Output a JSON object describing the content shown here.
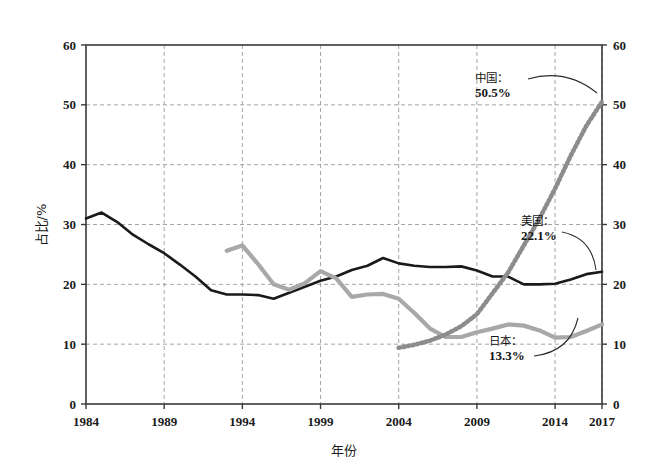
{
  "chart_data": {
    "type": "line",
    "title": "",
    "subtitle": "",
    "xlabel": "年份",
    "ylabel": "占比/%",
    "ylabel_right": "",
    "xlim": [
      1984,
      2017
    ],
    "ylim": [
      0,
      60
    ],
    "grid": true,
    "legend_position": "none",
    "xticks": [
      "1984",
      "1989",
      "1994",
      "1999",
      "2004",
      "2009",
      "2014",
      "2017"
    ],
    "xtick_values": [
      1984,
      1989,
      1994,
      1999,
      2004,
      2009,
      2014,
      2017
    ],
    "yticks": [
      "0",
      "10",
      "20",
      "30",
      "40",
      "50",
      "60"
    ],
    "ytick_values": [
      0,
      10,
      20,
      30,
      40,
      50,
      60
    ],
    "yticks_right": [
      "0",
      "10",
      "20",
      "30",
      "40",
      "50",
      "60"
    ],
    "dual_axis": true,
    "series": [
      {
        "name": "美国",
        "label": "美国：",
        "end_value_label": "22.1%",
        "color": "#1a1a1a",
        "style": "solid",
        "width": 2.6,
        "x": [
          1984,
          1985,
          1986,
          1987,
          1988,
          1989,
          1990,
          1991,
          1992,
          1993,
          1994,
          1995,
          1996,
          1997,
          1998,
          1999,
          2000,
          2001,
          2002,
          2003,
          2004,
          2005,
          2006,
          2007,
          2008,
          2009,
          2010,
          2011,
          2012,
          2013,
          2014,
          2015,
          2016,
          2017
        ],
        "values": [
          31.0,
          32.0,
          30.4,
          28.3,
          26.7,
          25.2,
          23.3,
          21.3,
          19.0,
          18.3,
          18.3,
          18.2,
          17.6,
          18.6,
          19.6,
          20.6,
          21.3,
          22.4,
          23.1,
          24.4,
          23.5,
          23.1,
          22.9,
          22.9,
          23.0,
          22.3,
          21.3,
          21.3,
          20.0,
          20.0,
          20.1,
          20.8,
          21.7,
          22.1
        ]
      },
      {
        "name": "日本",
        "label": "日本：",
        "end_value_label": "13.3%",
        "color": "#a8a8a8",
        "style": "solid",
        "width": 4.2,
        "x": [
          1993,
          1994,
          1995,
          1996,
          1997,
          1998,
          1999,
          2000,
          2001,
          2002,
          2003,
          2004,
          2005,
          2006,
          2007,
          2008,
          2009,
          2010,
          2011,
          2012,
          2013,
          2014,
          2015,
          2016,
          2017
        ],
        "values": [
          25.6,
          26.5,
          23.4,
          20.0,
          19.1,
          20.2,
          22.2,
          21.0,
          17.9,
          18.3,
          18.4,
          17.6,
          15.2,
          12.6,
          11.2,
          11.2,
          12.0,
          12.6,
          13.3,
          13.1,
          12.3,
          11.1,
          11.2,
          12.2,
          13.3
        ]
      },
      {
        "name": "中国",
        "label": "中国：",
        "end_value_label": "50.5%",
        "color": "#8c8c8c",
        "style": "dotted",
        "width": 4.6,
        "x": [
          2004,
          2005,
          2006,
          2007,
          2008,
          2009,
          2010,
          2011,
          2012,
          2013,
          2014,
          2015,
          2016,
          2017
        ],
        "values": [
          9.4,
          9.9,
          10.6,
          11.6,
          13.0,
          15.0,
          18.5,
          22.0,
          26.5,
          31.0,
          36.0,
          41.5,
          46.5,
          50.5
        ]
      }
    ],
    "annotations": [
      {
        "id": "china",
        "country": "中国：",
        "value": "50.5%",
        "x_px": 475,
        "y_px": 82
      },
      {
        "id": "usa",
        "country": "美国：",
        "value": "22.1%",
        "x_px": 521,
        "y_px": 225
      },
      {
        "id": "japan",
        "country": "日本：",
        "value": "13.3%",
        "x_px": 489,
        "y_px": 345
      }
    ]
  },
  "plot_area": {
    "left": 86,
    "top": 45,
    "right": 602,
    "bottom": 404
  }
}
